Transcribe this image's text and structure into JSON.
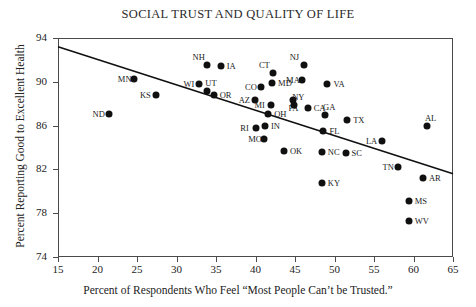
{
  "chart_data": {
    "type": "scatter",
    "title": "SOCIAL TRUST AND QUALITY OF LIFE",
    "xlabel": "Percent of Respondents Who Feel “Most People Can’t be Trusted.”",
    "ylabel": "Percent Reporting Good to Excellent Health",
    "xlim": [
      15,
      65
    ],
    "ylim": [
      74,
      94
    ],
    "xticks": [
      15,
      20,
      25,
      30,
      35,
      40,
      45,
      50,
      55,
      60,
      65
    ],
    "yticks": [
      74,
      78,
      82,
      86,
      90,
      94
    ],
    "grid": false,
    "legend": null,
    "marker_color": "#101010",
    "axis_color": "#4a4a4a",
    "trendline": {
      "type": "line",
      "x": [
        15,
        65
      ],
      "y": [
        93.2,
        81.6
      ]
    },
    "points": [
      {
        "label": "ND",
        "x": 21.4,
        "y": 87.1,
        "label_pos": "left"
      },
      {
        "label": "MN",
        "x": 24.6,
        "y": 90.3,
        "label_pos": "left"
      },
      {
        "label": "KS",
        "x": 27.4,
        "y": 88.8,
        "label_pos": "left"
      },
      {
        "label": "WI",
        "x": 32.9,
        "y": 89.8,
        "label_pos": "left"
      },
      {
        "label": "NH",
        "x": 33.8,
        "y": 91.5,
        "label_pos": "upleft"
      },
      {
        "label": "UT",
        "x": 33.9,
        "y": 89.2,
        "label_pos": "upright"
      },
      {
        "label": "OR",
        "x": 34.7,
        "y": 88.8,
        "label_pos": "right"
      },
      {
        "label": "IA",
        "x": 35.6,
        "y": 91.4,
        "label_pos": "right"
      },
      {
        "label": "AZ",
        "x": 39.9,
        "y": 88.3,
        "label_pos": "left"
      },
      {
        "label": "RI",
        "x": 40.1,
        "y": 85.8,
        "label_pos": "left"
      },
      {
        "label": "CO",
        "x": 40.7,
        "y": 89.5,
        "label_pos": "left"
      },
      {
        "label": "MO",
        "x": 41.1,
        "y": 84.8,
        "label_pos": "left"
      },
      {
        "label": "IN",
        "x": 41.2,
        "y": 86.0,
        "label_pos": "right"
      },
      {
        "label": "MI",
        "x": 41.9,
        "y": 87.9,
        "label_pos": "left"
      },
      {
        "label": "OH",
        "x": 41.6,
        "y": 87.1,
        "label_pos": "right"
      },
      {
        "label": "CT",
        "x": 42.2,
        "y": 90.8,
        "label_pos": "upleft"
      },
      {
        "label": "MD",
        "x": 42.1,
        "y": 89.9,
        "label_pos": "right"
      },
      {
        "label": "OK",
        "x": 43.6,
        "y": 83.7,
        "label_pos": "right"
      },
      {
        "label": "PA",
        "x": 44.8,
        "y": 88.3,
        "label_pos": "down"
      },
      {
        "label": "NY",
        "x": 44.9,
        "y": 87.9,
        "label_pos": "upright"
      },
      {
        "label": "MA",
        "x": 45.9,
        "y": 90.2,
        "label_pos": "left"
      },
      {
        "label": "NJ",
        "x": 46.1,
        "y": 91.5,
        "label_pos": "upleft"
      },
      {
        "label": "CA",
        "x": 46.6,
        "y": 87.6,
        "label_pos": "right"
      },
      {
        "label": "FL",
        "x": 48.6,
        "y": 85.5,
        "label_pos": "right"
      },
      {
        "label": "NC",
        "x": 48.4,
        "y": 83.6,
        "label_pos": "right"
      },
      {
        "label": "KY",
        "x": 48.4,
        "y": 80.8,
        "label_pos": "right"
      },
      {
        "label": "GA",
        "x": 48.8,
        "y": 87.0,
        "label_pos": "upright"
      },
      {
        "label": "VA",
        "x": 49.1,
        "y": 89.8,
        "label_pos": "right"
      },
      {
        "label": "SC",
        "x": 51.4,
        "y": 83.5,
        "label_pos": "right"
      },
      {
        "label": "TX",
        "x": 51.6,
        "y": 86.5,
        "label_pos": "right"
      },
      {
        "label": "LA",
        "x": 56.0,
        "y": 84.6,
        "label_pos": "left"
      },
      {
        "label": "TN",
        "x": 58.1,
        "y": 82.2,
        "label_pos": "left"
      },
      {
        "label": "MS",
        "x": 59.4,
        "y": 79.1,
        "label_pos": "right"
      },
      {
        "label": "WV",
        "x": 59.4,
        "y": 77.3,
        "label_pos": "right"
      },
      {
        "label": "AR",
        "x": 61.2,
        "y": 81.2,
        "label_pos": "right"
      },
      {
        "label": "AL",
        "x": 61.7,
        "y": 86.0,
        "label_pos": "upright"
      }
    ]
  }
}
